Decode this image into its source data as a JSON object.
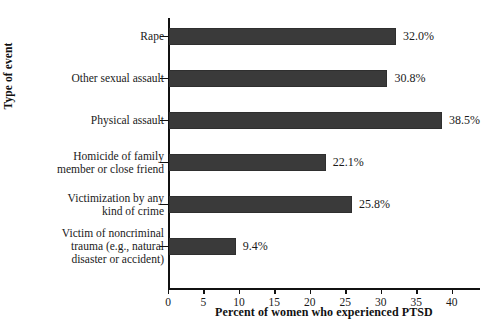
{
  "chart_data": {
    "type": "bar",
    "orientation": "horizontal",
    "title": "",
    "xlabel": "Percent of women who experienced PTSD",
    "ylabel": "Type of event",
    "xlim": [
      0,
      44
    ],
    "xticks": [
      0,
      5,
      10,
      15,
      20,
      25,
      30,
      35,
      40
    ],
    "xticklabels": [
      "0",
      "5",
      "10",
      "15",
      "20",
      "25",
      "30",
      "35",
      "40"
    ],
    "grid": false,
    "legend": null,
    "bar_color": "#3a3a3a",
    "categories": [
      "Rape",
      "Other sexual assault",
      "Physical assault",
      "Homicide of family\nmember or close friend",
      "Victimization by any\nkind of crime",
      "Victim of noncriminal\ntrauma (e.g., natural\ndisaster or accident)"
    ],
    "values": [
      32.0,
      30.8,
      38.5,
      22.1,
      25.8,
      9.4
    ],
    "data_labels": [
      "32.0%",
      "30.8%",
      "38.5%",
      "22.1%",
      "25.8%",
      "9.4%"
    ]
  }
}
